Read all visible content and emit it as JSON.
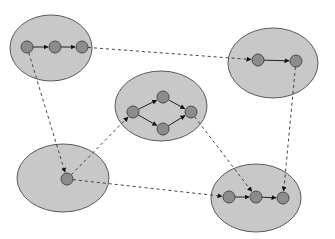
{
  "diagram": {
    "title": "",
    "colors": {
      "background": "#ffffff",
      "cluster_fill": "#c8c8c8",
      "cluster_stroke": "#5a5a5a",
      "node_fill": "#8c8c8c",
      "node_stroke": "#4a4a4a",
      "edge_solid": "#222222",
      "edge_dashed": "#444444"
    },
    "clusters": [
      {
        "id": "A",
        "cx": 51,
        "cy": 48,
        "rx": 41,
        "ry": 33
      },
      {
        "id": "B",
        "cx": 273,
        "cy": 63,
        "rx": 45,
        "ry": 35
      },
      {
        "id": "C",
        "cx": 161,
        "cy": 106,
        "rx": 46,
        "ry": 35
      },
      {
        "id": "D",
        "cx": 63,
        "cy": 178,
        "rx": 46,
        "ry": 34
      },
      {
        "id": "E",
        "cx": 256,
        "cy": 198,
        "rx": 45,
        "ry": 34
      }
    ],
    "nodes": [
      {
        "id": "a1",
        "cluster": "A",
        "x": 27,
        "y": 47
      },
      {
        "id": "a2",
        "cluster": "A",
        "x": 55,
        "y": 47
      },
      {
        "id": "a3",
        "cluster": "A",
        "x": 82,
        "y": 47
      },
      {
        "id": "b1",
        "cluster": "B",
        "x": 258,
        "y": 60
      },
      {
        "id": "b2",
        "cluster": "B",
        "x": 296,
        "y": 61
      },
      {
        "id": "c1",
        "cluster": "C",
        "x": 133,
        "y": 112
      },
      {
        "id": "c2",
        "cluster": "C",
        "x": 163,
        "y": 97
      },
      {
        "id": "c3",
        "cluster": "C",
        "x": 163,
        "y": 129
      },
      {
        "id": "c4",
        "cluster": "C",
        "x": 191,
        "y": 112
      },
      {
        "id": "d1",
        "cluster": "D",
        "x": 67,
        "y": 179
      },
      {
        "id": "e1",
        "cluster": "E",
        "x": 229,
        "y": 197
      },
      {
        "id": "e2",
        "cluster": "E",
        "x": 256,
        "y": 197
      },
      {
        "id": "e3",
        "cluster": "E",
        "x": 283,
        "y": 198
      }
    ],
    "edges": [
      {
        "from": "a1",
        "to": "a2",
        "style": "solid"
      },
      {
        "from": "a2",
        "to": "a3",
        "style": "solid"
      },
      {
        "from": "b1",
        "to": "b2",
        "style": "solid"
      },
      {
        "from": "c1",
        "to": "c2",
        "style": "solid"
      },
      {
        "from": "c1",
        "to": "c3",
        "style": "solid"
      },
      {
        "from": "c2",
        "to": "c4",
        "style": "solid"
      },
      {
        "from": "c3",
        "to": "c4",
        "style": "solid"
      },
      {
        "from": "e1",
        "to": "e2",
        "style": "solid"
      },
      {
        "from": "e2",
        "to": "e3",
        "style": "solid"
      },
      {
        "from": "a3",
        "to": "b1",
        "style": "dashed"
      },
      {
        "from": "a1",
        "to": "d1",
        "style": "dashed"
      },
      {
        "from": "d1",
        "to": "c1",
        "style": "dashed"
      },
      {
        "from": "d1",
        "to": "e1",
        "style": "dashed"
      },
      {
        "from": "c4",
        "to": "e2",
        "style": "dashed"
      },
      {
        "from": "b2",
        "to": "e3",
        "style": "dashed"
      }
    ]
  }
}
